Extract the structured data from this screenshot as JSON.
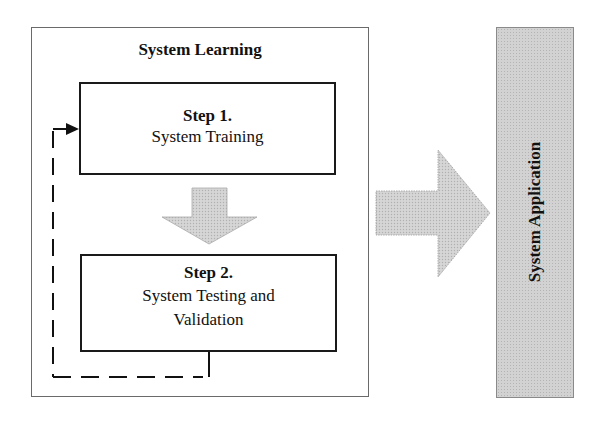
{
  "diagram": {
    "type": "flow",
    "group": {
      "title": "System Learning"
    },
    "steps": [
      {
        "number": "Step 1.",
        "label": "System Training"
      },
      {
        "number": "Step 2.",
        "label": "System Testing and Validation",
        "label_lines": [
          "System Testing and",
          "Validation"
        ]
      }
    ],
    "output": {
      "label": "System Application"
    },
    "connectors": [
      {
        "from": "Step 1.",
        "to": "Step 2.",
        "style": "block-arrow-down"
      },
      {
        "from": "Step 2.",
        "to": "Step 1.",
        "style": "dashed-feedback-loop"
      },
      {
        "from": "System Learning",
        "to": "System Application",
        "style": "block-arrow-right"
      }
    ],
    "colors": {
      "box_border": "#1a1a1a",
      "group_border": "#6a6a6a",
      "arrow_fill": "#d3d3d3",
      "app_fill": "#d2d2d2"
    }
  }
}
